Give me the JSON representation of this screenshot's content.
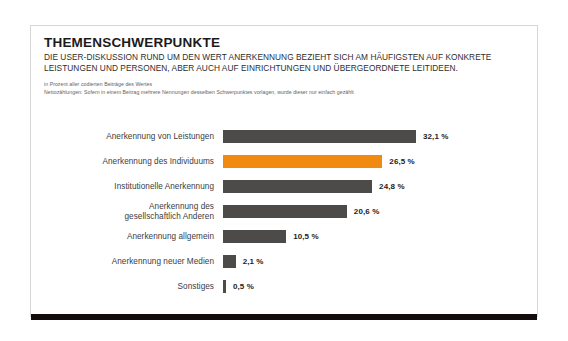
{
  "card": {
    "title": "THEMENSCHWERPUNKTE",
    "subtitle_line1": "DIE USER-DISKUSSION RUND UM DEN WERT ANERKENNUNG BEZIEHT SICH AM HÄUFIGSTEN AUF KONKRETE",
    "subtitle_line2": "LEISTUNGEN UND PERSONEN, ABER AUCH AUF EINRICHTUNGEN UND ÜBERGEORDNETE LEITIDEEN.",
    "note_line1": "in Prozent aller codierten Beiträge des Wertes",
    "note_line2": "Nettozählungen: Sofern in einem Beitrag mehrere Nennungen desselben Schwerpunktes vorlagen, wurde dieser nur einfach gezählt"
  },
  "colors": {
    "bar": "#4d4a4a",
    "accent": "#f08a10",
    "footer": "#120c0c",
    "card_border": "#d7d7d7"
  },
  "chart_data": {
    "type": "bar",
    "orientation": "horizontal",
    "title": "THEMENSCHWERPUNKTE",
    "subtitle": "DIE USER-DISKUSSION RUND UM DEN WERT ANERKENNUNG BEZIEHT SICH AM HÄUFIGSTEN AUF KONKRETE LEISTUNGEN UND PERSONEN, ABER AUCH AUF EINRICHTUNGEN UND ÜBERGEORDNETE LEITIDEEN.",
    "xlabel": "",
    "ylabel": "",
    "xlim": [
      0,
      32.1
    ],
    "grid": false,
    "legend": false,
    "unit": "%",
    "categories": [
      "Anerkennung von Leistungen",
      "Anerkennung des Individuums",
      "Institutionelle Anerkennung",
      "Anerkennung des gesellschaftlich Anderen",
      "Anerkennung allgemein",
      "Anerkennung neuer Medien",
      "Sonstiges"
    ],
    "values": [
      32.1,
      26.5,
      24.8,
      20.6,
      10.5,
      2.1,
      0.5
    ],
    "value_labels": [
      "32,1 %",
      "26,5 %",
      "24,8 %",
      "20,6 %",
      "10,5 %",
      "2,1 %",
      "0,5 %"
    ],
    "highlight_index": 1,
    "rows": [
      {
        "label_line1": "Anerkennung von Leistungen",
        "label_line2": "",
        "value": 32.1,
        "value_label": "32,1 %",
        "accent": false
      },
      {
        "label_line1": "Anerkennung des Individuums",
        "label_line2": "",
        "value": 26.5,
        "value_label": "26,5 %",
        "accent": true
      },
      {
        "label_line1": "Institutionelle Anerkennung",
        "label_line2": "",
        "value": 24.8,
        "value_label": "24,8 %",
        "accent": false
      },
      {
        "label_line1": "Anerkennung des",
        "label_line2": "gesellschaftlich Anderen",
        "value": 20.6,
        "value_label": "20,6 %",
        "accent": false
      },
      {
        "label_line1": "Anerkennung allgemein",
        "label_line2": "",
        "value": 10.5,
        "value_label": "10,5 %",
        "accent": false
      },
      {
        "label_line1": "Anerkennung neuer Medien",
        "label_line2": "",
        "value": 2.1,
        "value_label": "2,1 %",
        "accent": false
      },
      {
        "label_line1": "Sonstiges",
        "label_line2": "",
        "value": 0.5,
        "value_label": "0,5 %",
        "accent": false
      }
    ]
  }
}
